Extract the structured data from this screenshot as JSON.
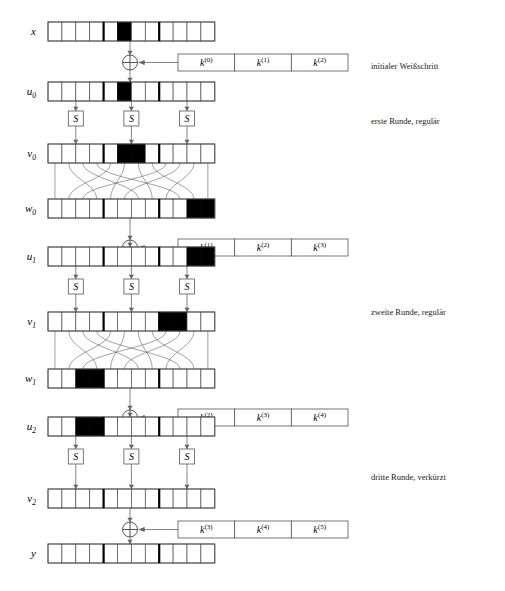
{
  "figure": {
    "block_count": 3,
    "cells_per_block": 4,
    "total_cells": 12
  },
  "rows": [
    {
      "id": "x",
      "label": "x",
      "sub": "",
      "active_cells": [
        6
      ],
      "note": "Klartext"
    },
    {
      "id": "u0",
      "label": "u",
      "sub": "0",
      "active_cells": [
        6
      ],
      "note": "nach initialem Weisschritt"
    },
    {
      "id": "v0",
      "label": "v",
      "sub": "0",
      "active_cells": [
        6,
        7
      ],
      "note": "nach S-Box erste Runde"
    },
    {
      "id": "w0",
      "label": "w",
      "sub": "0",
      "active_cells": [
        11,
        12
      ],
      "note": "nach Permutation erste Runde"
    },
    {
      "id": "u1",
      "label": "u",
      "sub": "1",
      "active_cells": [
        11,
        12
      ],
      "note": "nach Rundenschluessel eins"
    },
    {
      "id": "v1",
      "label": "v",
      "sub": "1",
      "active_cells": [
        9,
        10
      ],
      "note": "nach S-Box zweite Runde"
    },
    {
      "id": "w1",
      "label": "w",
      "sub": "1",
      "active_cells": [
        3,
        4
      ],
      "note": "nach Permutation zweite Runde"
    },
    {
      "id": "u2",
      "label": "u",
      "sub": "2",
      "active_cells": [
        3,
        4
      ],
      "note": "nach Rundenschluessel zwei"
    },
    {
      "id": "v2",
      "label": "v",
      "sub": "2",
      "active_cells": [],
      "note": "nach S-Box dritte Runde"
    },
    {
      "id": "y",
      "label": "y",
      "sub": "",
      "active_cells": [],
      "note": "Schluesseltext"
    }
  ],
  "key_boxes": [
    {
      "id": "key-round-0",
      "parts": [
        {
          "base": "k",
          "sup": "(0)"
        },
        {
          "base": "k",
          "sup": "(1)"
        },
        {
          "base": "k",
          "sup": "(2)"
        }
      ]
    },
    {
      "id": "key-round-1",
      "parts": [
        {
          "base": "k",
          "sup": "(1)"
        },
        {
          "base": "k",
          "sup": "(2)"
        },
        {
          "base": "k",
          "sup": "(3)"
        }
      ]
    },
    {
      "id": "key-round-2",
      "parts": [
        {
          "base": "k",
          "sup": "(2)"
        },
        {
          "base": "k",
          "sup": "(3)"
        },
        {
          "base": "k",
          "sup": "(4)"
        }
      ]
    },
    {
      "id": "key-round-3",
      "parts": [
        {
          "base": "k",
          "sup": "(3)"
        },
        {
          "base": "k",
          "sup": "(4)"
        },
        {
          "base": "k",
          "sup": "(5)"
        }
      ]
    }
  ],
  "sbox_rows": [
    {
      "id": "sbox-round-1",
      "labels": [
        "S",
        "S",
        "S"
      ]
    },
    {
      "id": "sbox-round-2",
      "labels": [
        "S",
        "S",
        "S"
      ]
    },
    {
      "id": "sbox-round-3",
      "labels": [
        "S",
        "S",
        "S"
      ]
    }
  ],
  "annotations": [
    {
      "id": "annotation-initial",
      "text": "initialer Weißschritt"
    },
    {
      "id": "annotation-round-1",
      "text": "erste Runde, regulär"
    },
    {
      "id": "annotation-round-2",
      "text": "zweite Runde, regulär"
    },
    {
      "id": "annotation-round-3",
      "text": "dritte Runde, verkürzt"
    }
  ],
  "operator": {
    "xor_symbol": "⊕",
    "xor_count": 4
  },
  "colors": {
    "active_cell": "#000000",
    "cell_fill": "#ffffff",
    "cell_stroke": "#4d4d4d",
    "separator": "#000000",
    "wire": "#555555",
    "text": "#1a1a1a"
  }
}
